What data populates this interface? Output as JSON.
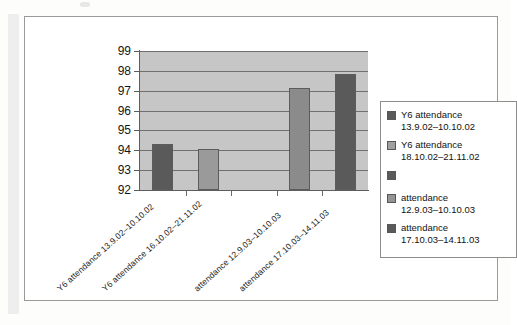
{
  "chart_data": {
    "type": "bar",
    "title": "",
    "xlabel": "",
    "ylabel": "",
    "ylim": [
      92,
      99
    ],
    "grid": true,
    "legend_position": "right",
    "y_ticks": [
      "99",
      "98",
      "97",
      "96",
      "95",
      "94",
      "93",
      "92"
    ],
    "categories": [
      "Y6 attendance 13.9.02–10.10.02",
      "Y6 attendance 16.10.02–21.11.02",
      "",
      "attendance 12.9.03–10.10.03",
      "attendance 17.10.03–14.11.03"
    ],
    "values": [
      94.3,
      94.05,
      null,
      97.15,
      97.85
    ],
    "bar_colors": [
      "#5a5a5a",
      "#9a9a9a",
      "#5a5a5a",
      "#8b8b8b",
      "#5a5a5a"
    ],
    "legend": [
      {
        "label_line1": "Y6 attendance",
        "label_line2": "13.9.02–10.10.02",
        "color": "#5a5a5a"
      },
      {
        "label_line1": "Y6 attendance",
        "label_line2": "18.10.02–21.11.02",
        "color": "#a0a0a0"
      },
      {
        "label_line1": "",
        "label_line2": "",
        "color": "#5a5a5a"
      },
      {
        "label_line1": "attendance",
        "label_line2": "12.9.03–10.10.03",
        "color": "#949494"
      },
      {
        "label_line1": "attendance",
        "label_line2": "17.10.03–14.11.03",
        "color": "#5a5a5a"
      }
    ],
    "plot_background": "#c6c6c6",
    "gridline_color": "#6f6f6f"
  }
}
